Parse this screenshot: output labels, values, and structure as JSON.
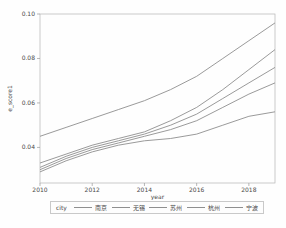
{
  "figure": {
    "background": "#fefefe"
  },
  "chart_data": {
    "type": "line",
    "title": "",
    "xlabel": "year",
    "ylabel": "e_score1",
    "x": [
      2010,
      2011,
      2012,
      2013,
      2014,
      2015,
      2016,
      2017,
      2018,
      2019
    ],
    "xticks": [
      2010,
      2012,
      2014,
      2016,
      2018
    ],
    "yticks": [
      0.04,
      0.06,
      0.08,
      0.1
    ],
    "xlim": [
      2010,
      2019
    ],
    "ylim": [
      0.024,
      0.1
    ],
    "grid": false,
    "legend_position": "bottom",
    "legend_title": "city",
    "line_color": "#8f8f8f",
    "axis_color": "#b5b5b5",
    "tick_color": "#9a9a9a",
    "text_color": "#4a4a4a",
    "series": [
      {
        "name": "南京",
        "values": [
          0.045,
          0.049,
          0.053,
          0.057,
          0.061,
          0.066,
          0.072,
          0.08,
          0.088,
          0.096
        ]
      },
      {
        "name": "无锡",
        "values": [
          0.033,
          0.037,
          0.041,
          0.044,
          0.047,
          0.052,
          0.058,
          0.066,
          0.075,
          0.084
        ]
      },
      {
        "name": "苏州",
        "values": [
          0.031,
          0.036,
          0.04,
          0.043,
          0.046,
          0.05,
          0.055,
          0.062,
          0.069,
          0.076
        ]
      },
      {
        "name": "杭州",
        "values": [
          0.03,
          0.035,
          0.039,
          0.042,
          0.045,
          0.048,
          0.052,
          0.058,
          0.064,
          0.069
        ]
      },
      {
        "name": "宁波",
        "values": [
          0.029,
          0.034,
          0.038,
          0.041,
          0.043,
          0.044,
          0.046,
          0.05,
          0.054,
          0.056
        ]
      }
    ]
  }
}
